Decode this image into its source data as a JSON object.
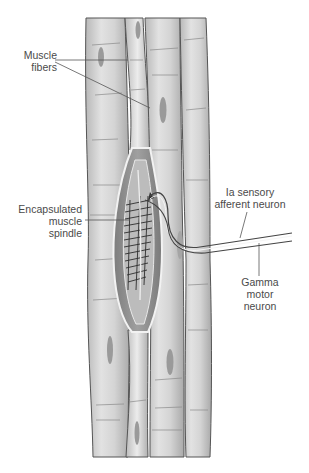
{
  "diagram": {
    "labels": {
      "muscle_fibers": [
        "Muscle",
        "fibers"
      ],
      "spindle": [
        "Encapsulated",
        "muscle",
        "spindle"
      ],
      "ia_afferent": [
        "Ia sensory",
        "afferent neuron"
      ],
      "gamma_motor": [
        "Gamma",
        "motor",
        "neuron"
      ]
    },
    "colors": {
      "fiber_fill": "#cfcfcf",
      "fiber_highlight": "#e6e6e6",
      "fiber_outline": "#555555",
      "nucleus": "#9a9a9a",
      "capsule_fill": "#8f8f8f",
      "intrafusal_fill": "#bdbdbd",
      "striation": "#2e2e2e",
      "leader_line": "#555555",
      "text": "#4a4a4a"
    }
  }
}
